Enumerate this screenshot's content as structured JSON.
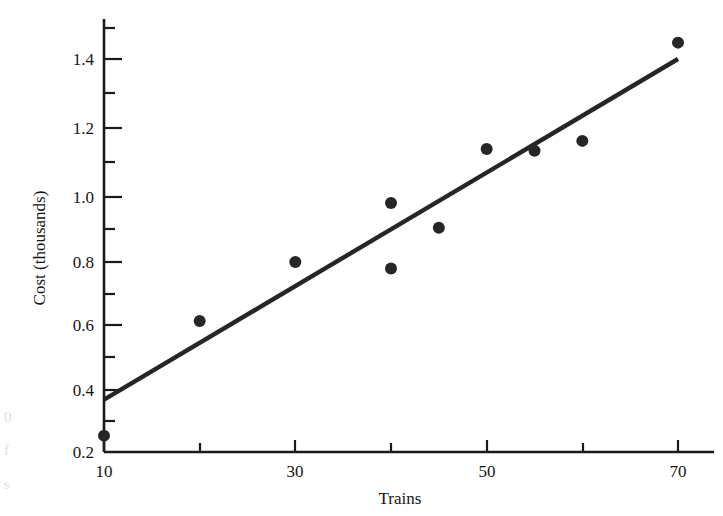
{
  "figure": {
    "background_color": "#ffffff",
    "ink_color": "#1a1a1a"
  },
  "chart_data": {
    "type": "scatter",
    "title": "",
    "xlabel": "Trains",
    "ylabel": "Cost (thousands)",
    "xlim": [
      10,
      71
    ],
    "ylim": [
      0.2,
      1.52
    ],
    "grid": false,
    "legend": null,
    "x_ticks_major": [
      10,
      30,
      50,
      70
    ],
    "x_tick_labels": [
      "10",
      "30",
      "50",
      "70"
    ],
    "x_ticks_minor": [
      20,
      40,
      60
    ],
    "y_ticks_major": [
      0.2,
      0.4,
      0.6,
      0.8,
      1.0,
      1.2,
      1.4
    ],
    "y_tick_labels": [
      "0.2",
      "0.4",
      "0.6",
      "0.8",
      "1.0",
      "1.2",
      "1.4"
    ],
    "y_ticks_minor": [
      0.3,
      0.5,
      0.7,
      0.9,
      1.1,
      1.3,
      1.5
    ],
    "marker": "filled-circle",
    "marker_color": "#262626",
    "marker_radius": 6,
    "x": [
      10,
      20,
      30,
      40,
      40,
      45,
      50,
      55,
      60,
      70
    ],
    "y": [
      0.25,
      0.6,
      0.78,
      0.96,
      0.76,
      0.885,
      1.125,
      1.12,
      1.15,
      1.45
    ],
    "points": [
      {
        "x": 10,
        "y": 0.25
      },
      {
        "x": 20,
        "y": 0.6
      },
      {
        "x": 30,
        "y": 0.78
      },
      {
        "x": 40,
        "y": 0.96
      },
      {
        "x": 40,
        "y": 0.76
      },
      {
        "x": 45,
        "y": 0.885
      },
      {
        "x": 50,
        "y": 1.125
      },
      {
        "x": 55,
        "y": 1.12
      },
      {
        "x": 60,
        "y": 1.15
      },
      {
        "x": 70,
        "y": 1.45
      }
    ],
    "series": [
      {
        "name": "Observations",
        "type": "scatter",
        "values": [
          0.25,
          0.6,
          0.78,
          0.96,
          0.76,
          0.885,
          1.125,
          1.12,
          1.15,
          1.45
        ]
      },
      {
        "name": "Fitted line",
        "type": "line",
        "color": "#262626",
        "line_width": 4,
        "endpoints": [
          {
            "x": 10,
            "y": 0.36
          },
          {
            "x": 70,
            "y": 1.4
          }
        ],
        "slope": 0.01733,
        "intercept": 0.1867
      }
    ],
    "annotations": []
  },
  "edge_fragments": {
    "top": "0",
    "middle": "f",
    "bottom": "s"
  }
}
